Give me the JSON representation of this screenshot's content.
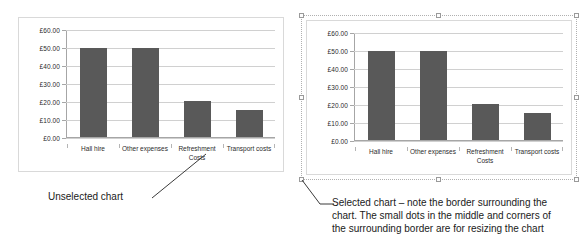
{
  "chart_data": [
    {
      "type": "bar",
      "title": "",
      "categories": [
        "Hall hire",
        "Other expenses",
        "Refreshment\nCosts",
        "Transport costs"
      ],
      "values": [
        50.0,
        50.0,
        20.0,
        15.0
      ],
      "ylim": [
        0,
        60
      ],
      "ytick_labels": [
        "£0.00",
        "£10.00",
        "£20.00",
        "£30.00",
        "£40.00",
        "£50.00",
        "£60.00"
      ],
      "ytick_values": [
        0,
        10,
        20,
        30,
        40,
        50,
        60
      ],
      "xlabel": "",
      "ylabel": "",
      "grid": true,
      "legend": false,
      "bar_color": "#595959",
      "state": "unselected"
    },
    {
      "type": "bar",
      "title": "",
      "categories": [
        "Hall hire",
        "Other expenses",
        "Refreshment\nCosts",
        "Transport costs"
      ],
      "values": [
        50.0,
        50.0,
        20.0,
        15.0
      ],
      "ylim": [
        0,
        60
      ],
      "ytick_labels": [
        "£0.00",
        "£10.00",
        "£20.00",
        "£30.00",
        "£40.00",
        "£50.00",
        "£60.00"
      ],
      "ytick_values": [
        0,
        10,
        20,
        30,
        40,
        50,
        60
      ],
      "xlabel": "",
      "ylabel": "",
      "grid": true,
      "legend": false,
      "bar_color": "#595959",
      "state": "selected"
    }
  ],
  "annotations": {
    "left_caption": "Unselected chart",
    "right_caption_line1": "Selected chart – note the border surrounding the",
    "right_caption_line2": "chart. The small dots in the middle and corners of",
    "right_caption_line3": "the surrounding border are for resizing the chart"
  },
  "colors": {
    "bar": "#595959",
    "gridline": "#d0d0d0",
    "axis": "#a6a6a6",
    "panel_border": "#d9d9d9",
    "selection_border": "#b0b0b0",
    "handle_fill": "#fdfdfd",
    "handle_stroke": "#9a9a9a",
    "text": "#1a1a1a",
    "background": "#ffffff"
  }
}
